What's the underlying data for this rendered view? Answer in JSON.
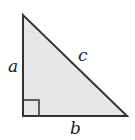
{
  "diagram": {
    "vertices": {
      "apex": [
        23,
        15
      ],
      "right_angle": [
        23,
        116
      ],
      "base_right": [
        127,
        116
      ]
    },
    "right_angle_marker_size": 16,
    "labels": {
      "a": "a",
      "b": "b",
      "c": "c"
    },
    "label_positions": {
      "a": [
        8,
        72
      ],
      "b": [
        70,
        134
      ],
      "c": [
        78,
        61
      ]
    },
    "colors": {
      "fill": "#e6e6e6",
      "stroke": "#333333",
      "text": "#222222",
      "background": "#ffffff"
    }
  }
}
